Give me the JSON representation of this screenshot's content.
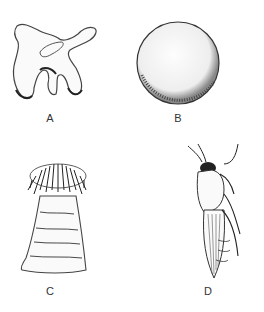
{
  "figure": {
    "panels": [
      {
        "id": "A",
        "label": "A",
        "subject": "irregular-amoeboid-organism"
      },
      {
        "id": "B",
        "label": "B",
        "subject": "spherical-organism"
      },
      {
        "id": "C",
        "label": "C",
        "subject": "sea-anemone"
      },
      {
        "id": "D",
        "label": "D",
        "subject": "insect-leafhopper"
      }
    ]
  }
}
